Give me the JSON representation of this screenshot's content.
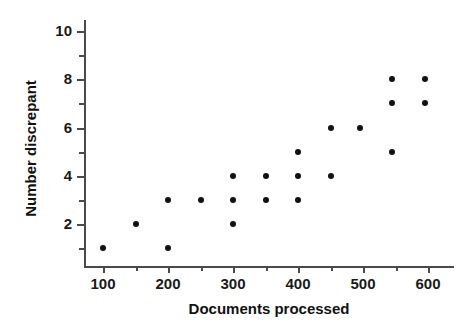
{
  "chart_data": {
    "type": "scatter",
    "title": "",
    "xlabel": "Documents processed",
    "ylabel": "Number discrepant",
    "xlim": [
      75,
      630
    ],
    "ylim": [
      0,
      10.6
    ],
    "grid": false,
    "legend": null,
    "x_ticks": [
      100,
      200,
      300,
      400,
      500,
      600
    ],
    "x_tick_labels": [
      "100",
      "200",
      "300",
      "400",
      "500",
      "600"
    ],
    "x_minor_ticks": [
      150,
      250,
      350,
      450,
      550
    ],
    "y_ticks": [
      2,
      4,
      6,
      8,
      10
    ],
    "y_tick_labels": [
      "2",
      "4",
      "6",
      "8",
      "10"
    ],
    "y_minor_ticks": [
      1,
      3,
      5,
      7,
      9
    ],
    "marker": "filled-circle",
    "marker_color": "#111111",
    "axis_color": "#4a4a4a",
    "background_color": "#ffffff",
    "points": [
      {
        "x": 100,
        "y": 1
      },
      {
        "x": 150,
        "y": 2
      },
      {
        "x": 200,
        "y": 1
      },
      {
        "x": 200,
        "y": 3
      },
      {
        "x": 250,
        "y": 3
      },
      {
        "x": 300,
        "y": 2
      },
      {
        "x": 300,
        "y": 3
      },
      {
        "x": 300,
        "y": 4
      },
      {
        "x": 350,
        "y": 3
      },
      {
        "x": 350,
        "y": 4
      },
      {
        "x": 400,
        "y": 3
      },
      {
        "x": 400,
        "y": 4
      },
      {
        "x": 400,
        "y": 5
      },
      {
        "x": 450,
        "y": 4
      },
      {
        "x": 450,
        "y": 6
      },
      {
        "x": 495,
        "y": 6
      },
      {
        "x": 545,
        "y": 5
      },
      {
        "x": 545,
        "y": 7
      },
      {
        "x": 545,
        "y": 8
      },
      {
        "x": 595,
        "y": 7
      },
      {
        "x": 595,
        "y": 8
      }
    ]
  }
}
